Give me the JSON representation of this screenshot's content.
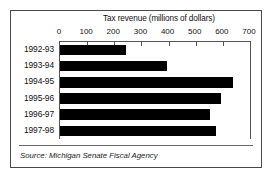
{
  "figure": {
    "source_note": "Source: Michigan Senate Fiscal Agency"
  },
  "chart_data": {
    "type": "bar",
    "orientation": "horizontal",
    "title": "Tax revenue (millions of dollars)",
    "xlabel": "",
    "ylabel": "",
    "categories": [
      "1992-93",
      "1993-94",
      "1994-95",
      "1995-96",
      "1996-97",
      "1997-98"
    ],
    "values": [
      244,
      396,
      637,
      592,
      552,
      574
    ],
    "series": [
      {
        "name": "Tax revenue",
        "values": [
          244,
          396,
          637,
          592,
          552,
          574
        ],
        "color": "#000000"
      }
    ],
    "xlim": [
      0,
      700
    ],
    "xticks": [
      0,
      100,
      200,
      300,
      400,
      500,
      600,
      700
    ],
    "xticklabels": [
      "0",
      "100",
      "200",
      "300",
      "400",
      "500",
      "600",
      "700"
    ],
    "grid": false,
    "legend": false,
    "bar_color": "#000000",
    "axis_color": "#555555",
    "background": "#ffffff"
  }
}
